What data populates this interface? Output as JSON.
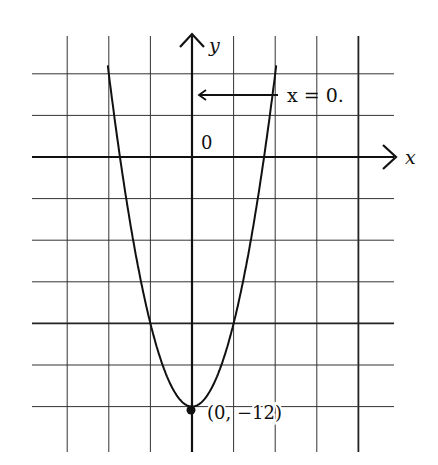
{
  "chart_data": {
    "type": "line",
    "title": "",
    "function": "y = x^2 - 12",
    "xlabel": "x",
    "ylabel": "y",
    "origin_label": "0",
    "vertex": {
      "x": 0,
      "y": -12,
      "label": "(0, −12)"
    },
    "axis_annotation": {
      "text": "x = 0.",
      "points_to": "y-axis"
    },
    "grid": true,
    "grid_step": {
      "x": 2,
      "y": 2
    },
    "xlim": [
      -6,
      8
    ],
    "ylim": [
      -14,
      8
    ],
    "series": [
      {
        "name": "parabola",
        "x": [
          -4,
          -3.46,
          -3,
          -2,
          -1,
          0,
          1,
          2,
          3,
          3.46,
          4
        ],
        "values": [
          4,
          0,
          -3,
          -8,
          -11,
          -12,
          -11,
          -8,
          -3,
          0,
          4
        ]
      }
    ]
  },
  "labels": {
    "y_axis": "y",
    "x_axis": "x",
    "origin": "0",
    "annotation": "x = 0.",
    "vertex": "(0, −12)"
  }
}
